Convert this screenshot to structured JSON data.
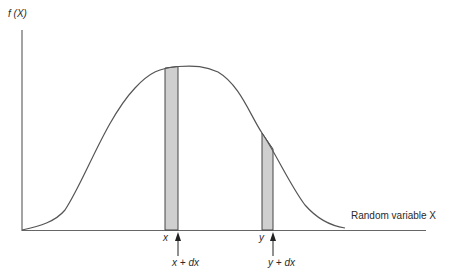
{
  "figure": {
    "y_axis_label": "f (X)",
    "x_axis_label": "Random variable X",
    "strips": [
      {
        "left_label": "x",
        "right_label": "x + dx"
      },
      {
        "left_label": "y",
        "right_label": "y + dx"
      }
    ]
  },
  "colors": {
    "line": "#555555",
    "strip_fill": "#c8c8c8",
    "text": "#2a2a2a",
    "background": "#ffffff"
  }
}
